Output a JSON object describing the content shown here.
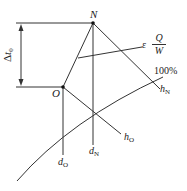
{
  "diagram": {
    "points": {
      "N": {
        "label": "N",
        "x": 93,
        "y": 22
      },
      "O": {
        "label": "O",
        "x": 63,
        "y": 87
      }
    },
    "delta_label": {
      "symbol": "Δ",
      "var": "t",
      "sub": "0"
    },
    "epsilon_label": {
      "prefix": "ε",
      "num": "Q",
      "den": "W"
    },
    "curve_label": "100%",
    "h_N": {
      "var": "h",
      "sub": "N"
    },
    "h_O": {
      "var": "h",
      "sub": "O"
    },
    "d_N": {
      "var": "d",
      "sub": "N"
    },
    "d_O": {
      "var": "d",
      "sub": "O"
    },
    "colors": {
      "line": "#333333",
      "background": "#ffffff"
    }
  }
}
